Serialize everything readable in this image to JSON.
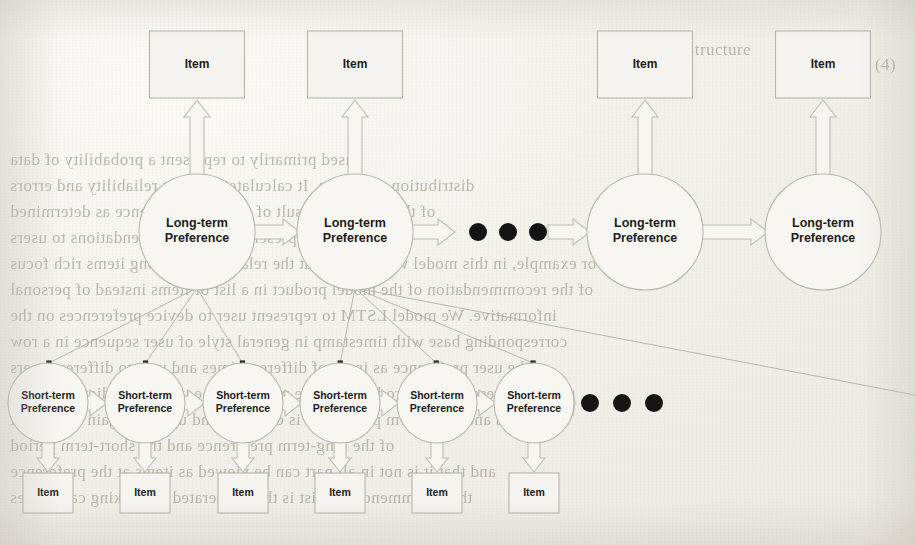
{
  "figure": {
    "kind": "hierarchical-sequence-diagram",
    "page_background": "#f2f0eb",
    "ink_color": "#b9b6ae",
    "text_color": "#1d1d1b",
    "dot_color": "#141414"
  },
  "labels": {
    "long_term": "Long-term\nPreference",
    "long_term_line1": "Long-term",
    "long_term_line2": "Preference",
    "short_term_line1": "Short-term",
    "short_term_line2": "Preference",
    "item": "Item"
  },
  "long_term_row": {
    "name": "long-term-preference-row",
    "cy": 232,
    "r": 58,
    "nodes": [
      {
        "id": "lt1",
        "cx": 197,
        "label_l1": "Long-term",
        "label_l2": "Preference"
      },
      {
        "id": "lt2",
        "cx": 355,
        "label_l1": "Long-term",
        "label_l2": "Preference"
      },
      {
        "id": "lt3",
        "cx": 645,
        "label_l1": "Long-term",
        "label_l2": "Preference"
      },
      {
        "id": "lt4",
        "cx": 823,
        "label_l1": "Long-term",
        "label_l2": "Preference"
      }
    ],
    "arrows": [
      {
        "from": 255,
        "to": 297,
        "y": 232
      },
      {
        "from": 587,
        "to": 587,
        "y": 232
      },
      {
        "from": 703,
        "to": 765,
        "y": 232
      }
    ],
    "ellipsis": {
      "name": "long-term-ellipsis",
      "cx": [
        478,
        508,
        538
      ],
      "cy": 232,
      "r": 9
    }
  },
  "top_items": {
    "name": "top-item-row",
    "y": 31,
    "w": 95,
    "h": 67,
    "nodes": [
      {
        "id": "top-item-1",
        "cx": 197,
        "label": "Item"
      },
      {
        "id": "top-item-2",
        "cx": 355,
        "label": "Item"
      },
      {
        "id": "top-item-3",
        "cx": 645,
        "label": "Item"
      },
      {
        "id": "top-item-4",
        "cx": 823,
        "label": "Item"
      }
    ]
  },
  "short_term_row": {
    "name": "short-term-preference-row",
    "cy": 403,
    "r": 40,
    "nodes": [
      {
        "id": "st1",
        "cx": 48,
        "label_l1": "Short-term",
        "label_l2": "Preference"
      },
      {
        "id": "st2",
        "cx": 145,
        "label_l1": "Short-term",
        "label_l2": "Preference"
      },
      {
        "id": "st3",
        "cx": 243,
        "label_l1": "Short-term",
        "label_l2": "Preference"
      },
      {
        "id": "st4",
        "cx": 340,
        "label_l1": "Short-term",
        "label_l2": "Preference"
      },
      {
        "id": "st5",
        "cx": 437,
        "label_l1": "Short-term",
        "label_l2": "Preference"
      },
      {
        "id": "st6",
        "cx": 534,
        "label_l1": "Short-term",
        "label_l2": "Preference"
      }
    ],
    "ellipsis": {
      "name": "short-term-ellipsis",
      "cx": [
        590,
        622,
        654
      ],
      "cy": 403,
      "r": 9
    }
  },
  "bottom_items": {
    "name": "bottom-item-row",
    "y": 473,
    "w": 50,
    "h": 40,
    "nodes": [
      {
        "id": "bot-item-1",
        "cx": 48,
        "label": "Item"
      },
      {
        "id": "bot-item-2",
        "cx": 145,
        "label": "Item"
      },
      {
        "id": "bot-item-3",
        "cx": 243,
        "label": "Item"
      },
      {
        "id": "bot-item-4",
        "cx": 340,
        "label": "Item"
      },
      {
        "id": "bot-item-5",
        "cx": 437,
        "label": "Item"
      },
      {
        "id": "bot-item-6",
        "cx": 534,
        "label": "Item"
      }
    ]
  },
  "fan_connections": [
    {
      "from": "lt1",
      "to": [
        "st1",
        "st2",
        "st3"
      ]
    },
    {
      "from": "lt2",
      "to": [
        "st4",
        "st5",
        "st6"
      ]
    }
  ],
  "ghost_text": {
    "note": "faint reversed bleed-through text from the opposite page",
    "lines": [
      {
        "x": 10,
        "y": 150,
        "text": "used primarily to represent a probability of data"
      },
      {
        "x": 10,
        "y": 176,
        "text": "distribution and so on. It calculate revenant reliability and errors"
      },
      {
        "x": 10,
        "y": 202,
        "text": "of the items is a result of the user preference as determined"
      },
      {
        "x": 10,
        "y": 228,
        "text": "from top representations recommendations to users"
      },
      {
        "x": 10,
        "y": 254,
        "text": "For example, in this model we assume that the relationship among items rich focus"
      },
      {
        "x": 10,
        "y": 280,
        "text": "of the recommendation of the model product in a list of items instead of personal"
      },
      {
        "x": 10,
        "y": 306,
        "text": "informative. We model LSTM to represent user to device preferences on the"
      },
      {
        "x": 10,
        "y": 332,
        "text": "corresponding base with timestamp in general style of user sequence in a row"
      },
      {
        "x": 10,
        "y": 358,
        "text": "the user preference as input of different times and user to different users"
      },
      {
        "x": 10,
        "y": 384,
        "text": "the representations produced by the model can be used to predict candidate"
      },
      {
        "x": 10,
        "y": 410,
        "text": "items and short-term preference is captured and updated again as a result"
      },
      {
        "x": 10,
        "y": 436,
        "text": "of the long-term preference and the short-term period"
      },
      {
        "x": 10,
        "y": 462,
        "text": "and that it is not in all part can be viewed as items at the preference"
      },
      {
        "x": 10,
        "y": 488,
        "text": "the recommendation list is then generated by ranking candidates"
      },
      {
        "x": 620,
        "y": 40,
        "text": "Figure 4  Structure"
      },
      {
        "x": 875,
        "y": 55,
        "text": "(4)"
      }
    ]
  }
}
